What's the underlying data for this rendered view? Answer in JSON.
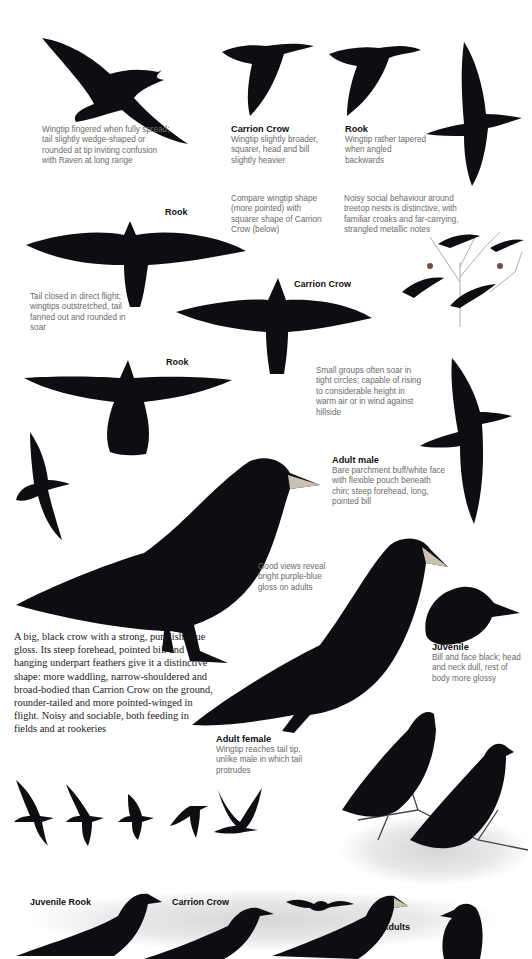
{
  "page": {
    "colors": {
      "ink": "#0e0e12",
      "caption": "#6a6a6a",
      "label": "#111111",
      "wash": "#d6d6d6"
    }
  },
  "captions": {
    "raven_range": "Wingtip fingered when fully spread; tail slightly wedge-shaped or rounded at tip inviting confusion with Raven at long range",
    "carrion_crow_top": {
      "title": "Carrion Crow",
      "text": "Wingtip slightly broader, squarer, head and bill slightly heavier"
    },
    "rook_top": {
      "title": "Rook",
      "text": "Wingtip rather tapered when angled backwards"
    },
    "compare_wingtip": "Compare wingtip shape (more pointed) with squarer shape of Carrion Crow (below)",
    "noisy_social": "Noisy social behaviour around treetop nests is distinctive, with familiar croaks and far-carrying, strangled metallic notes",
    "tail_closed": "Tail closed in direct flight; wingtips outstretched, tail fanned out and rounded in soar",
    "small_groups": "Small groups often soar in tight circles; capable of rising to considerable height in warm air or in wind against hillside",
    "adult_male": {
      "title": "Adult male",
      "text": "Bare parchment buff/white face with flexible pouch beneath chin; steep forehead, long, pointed bill"
    },
    "good_views": "Good views reveal bright purple-blue gloss on adults",
    "juvenile": {
      "title": "Juvenile",
      "text": "Bill and face black; head and neck dull, rest of body more glossy"
    },
    "adult_female": {
      "title": "Adult female",
      "text": "Wingtip reaches tail tip, unlike male in which tail protrudes"
    }
  },
  "labels": {
    "rook_1": "Rook",
    "carrion_crow_mid": "Carrion Crow",
    "rook_2": "Rook",
    "juvenile_rook": "Juvenile Rook",
    "carrion_crow_bottom": "Carrion Crow",
    "adults": "Adults"
  },
  "intro_text": "A big, black crow with a strong, purplish-blue gloss. Its steep forehead, pointed bill and hanging underpart feathers give it a distinctive shape: more waddling, narrow-shouldered and broad-bodied than Carrion Crow on the ground, rounder-tailed and more pointed-winged in flight. Noisy and sociable, both feeding in fields and at rookeries",
  "illustrations": [
    "rook-flying-topleft-illustration",
    "carrion-crow-flying-illustration",
    "rook-flying-tapered-illustration",
    "rook-flying-vertical-illustration",
    "rook-soaring-underside-illustration",
    "rookery-treetop-illustration",
    "carrion-crow-soaring-illustration",
    "rook-soaring-illustration-2",
    "rook-flying-side-illustration",
    "rook-small-flight-illustration",
    "adult-male-rook-standing-illustration",
    "adult-female-rook-perched-illustration",
    "juvenile-rook-head-illustration",
    "rooks-on-branch-illustration",
    "rook-flight-sequence-illustration",
    "bottom-comparison-row-illustration"
  ]
}
